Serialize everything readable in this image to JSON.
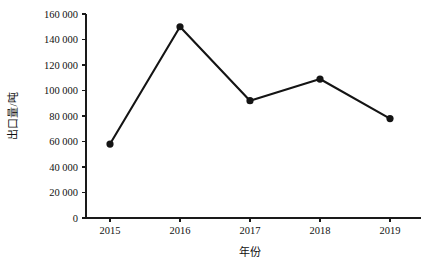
{
  "chart_data": {
    "type": "line",
    "title": "",
    "subtitle": "",
    "xlabel": "年份",
    "ylabel": "出口量/吨",
    "categories": [
      "2015",
      "2016",
      "2017",
      "2018",
      "2019"
    ],
    "x": [
      2015,
      2016,
      2017,
      2018,
      2019
    ],
    "values": [
      58000,
      150000,
      92000,
      109000,
      78000
    ],
    "series": [
      {
        "name": "出口量",
        "values": [
          58000,
          150000,
          92000,
          109000,
          78000
        ]
      }
    ],
    "ylim": [
      0,
      160000
    ],
    "y_ticks": [
      0,
      20000,
      40000,
      60000,
      80000,
      100000,
      120000,
      140000,
      160000
    ],
    "y_tick_labels": [
      "0",
      "20 000",
      "40 000",
      "60 000",
      "80 000",
      "100 000",
      "120 000",
      "140 000",
      "160 000"
    ],
    "x_tick_labels": [
      "2015",
      "2016",
      "2017",
      "2018",
      "2019"
    ],
    "grid": false,
    "legend": null,
    "legend_position": "none",
    "marker": "circle",
    "line_color": "#141414",
    "marker_color": "#141414",
    "axis_color": "#1a1a1a",
    "background_color": "#ffffff",
    "annotations": []
  }
}
